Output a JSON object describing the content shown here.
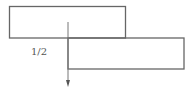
{
  "diagram": {
    "type": "offset-blocks",
    "stroke_color": "#666666",
    "arrow_color": "#777777",
    "shapes": [
      {
        "name": "upper-block",
        "x": 9.5,
        "y": 6.5,
        "width": 116,
        "height": 31.5
      },
      {
        "name": "lower-block",
        "x": 68,
        "y": 38,
        "width": 116,
        "height": 31
      }
    ],
    "arrow": {
      "x": 68,
      "y_start": 22,
      "y_end": 87,
      "direction": "down"
    },
    "labels": [
      {
        "name": "offset-fraction-label",
        "text": "1/2",
        "x": 31,
        "y": 47
      }
    ]
  }
}
